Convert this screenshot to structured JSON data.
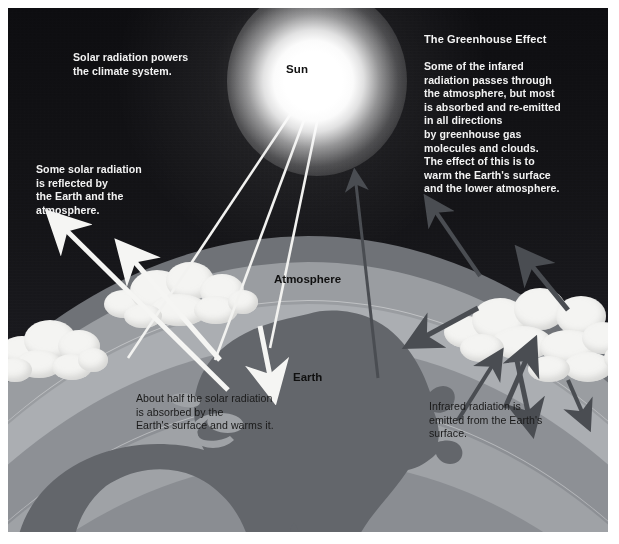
{
  "figure": {
    "title": "The Greenhouse Effect",
    "labels": {
      "sun": "Sun",
      "atmosphere": "Atmosphere",
      "earth": "Earth"
    },
    "annotations": {
      "solar_powers": "Solar radiation powers\nthe climate system.",
      "reflected": "Some solar radiation\nis reflected by\nthe Earth and the\natmosphere.",
      "absorbed": "About half the solar radiation\nis absorbed by the\nEarth's surface and warms it.",
      "emitted": "Infrared radiation is\nemitted from the Earth's\nsurface.",
      "greenhouse_body": "Some of the infared\nradiation passes through\nthe atmosphere, but most\nis absorbed and re-emitted\nin all directions\nby greenhouse gas\nmolecules and clouds.\nThe effect of this is to\nwarm the Earth's surface\nand the lower atmosphere."
    },
    "colors": {
      "sky_top": "#0d0d10",
      "sky_bottom": "#232329",
      "sun": "#ffffff",
      "band_outer": "#6f7277",
      "band_mid": "#9a9da1",
      "band_inner": "#abaeb2",
      "band_surface": "#8d9095",
      "continent": "#63666b",
      "cloud": "#f4f4f2",
      "solar_arrow": "#f5f5f3",
      "infrared_arrow": "#4a4d52",
      "text_light": "#f2f2f2",
      "text_dark": "#1a1a1a"
    }
  }
}
